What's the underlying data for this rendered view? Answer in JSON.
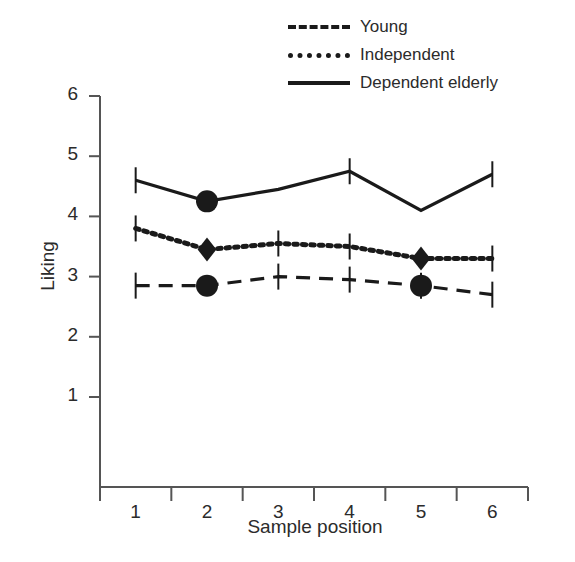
{
  "chart_data": {
    "type": "line",
    "title": "",
    "xlabel": "Sample position",
    "ylabel": "Liking",
    "categories": [
      "1",
      "2",
      "3",
      "4",
      "5",
      "6"
    ],
    "xlim": [
      0.5,
      6.5
    ],
    "ylim": [
      0,
      6
    ],
    "yticks": [
      1,
      2,
      3,
      4,
      5,
      6
    ],
    "grid": false,
    "legend_position": "top-right",
    "series": [
      {
        "name": "Young",
        "style": "dashed",
        "marker": "circle",
        "marker_positions": [
          2,
          5
        ],
        "color": "#1a1a1a",
        "values": [
          2.85,
          2.85,
          3.0,
          2.95,
          2.85,
          2.7
        ],
        "error_bar_positions": [
          1,
          3,
          4,
          5,
          6
        ]
      },
      {
        "name": "Independent",
        "style": "dotted",
        "marker": "diamond",
        "marker_positions": [
          2,
          5
        ],
        "color": "#1a1a1a",
        "values": [
          3.8,
          3.45,
          3.55,
          3.5,
          3.3,
          3.3
        ],
        "error_bar_positions": [
          1,
          3,
          4,
          6
        ]
      },
      {
        "name": "Dependent elderly",
        "style": "solid",
        "marker": "circle",
        "marker_positions": [
          2
        ],
        "color": "#1a1a1a",
        "values": [
          4.6,
          4.25,
          4.45,
          4.75,
          4.1,
          4.7
        ],
        "error_bar_positions": [
          1,
          4,
          6
        ]
      }
    ]
  },
  "legend": {
    "items": [
      {
        "label": "Young",
        "swatch": "dashed-line-swatch"
      },
      {
        "label": "Independent",
        "swatch": "dotted-line-swatch"
      },
      {
        "label": "Dependent elderly",
        "swatch": "solid-line-swatch"
      }
    ]
  },
  "axes": {
    "y_title": "Liking",
    "x_title": "Sample position",
    "y_tick_labels": [
      "6",
      "5",
      "4",
      "3",
      "2",
      "1"
    ],
    "x_tick_labels": [
      "1",
      "2",
      "3",
      "4",
      "5",
      "6"
    ]
  }
}
